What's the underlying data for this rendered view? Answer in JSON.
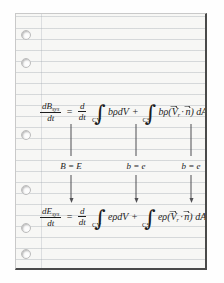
{
  "document": {
    "type": "handwritten-textbook-figure",
    "medium": "ruled notebook paper",
    "title": "Reynolds Transport Theorem specialized to energy",
    "paper": {
      "hole_count": 6,
      "hole_positions_y": [
        29,
        57,
        129,
        184,
        222,
        248
      ],
      "background_color": "#f7f7f5",
      "rule_color": "#969ea8",
      "border_color": "#4a4a4a"
    }
  },
  "equations": {
    "top": {
      "name": "general-reynolds-transport-theorem",
      "lhs": {
        "numerator": "dB",
        "numerator_subscript": "sys",
        "denominator": "dt"
      },
      "equals": "=",
      "rhs_operator_numerator": "d",
      "rhs_operator_denominator": "dt",
      "volume_integral": {
        "limit": "CV",
        "integrand": "bρdV"
      },
      "plus": "+",
      "surface_integral": {
        "limit": "CS",
        "integrand_prefix": "bρ(",
        "vector_v": "V",
        "vector_v_subscript": "r",
        "dot": "·",
        "vector_n": "n",
        "integrand_suffix": ") dA"
      }
    },
    "bottom": {
      "name": "energy-equation",
      "lhs": {
        "numerator": "dE",
        "numerator_subscript": "sys",
        "denominator": "dt"
      },
      "equals": "=",
      "rhs_operator_numerator": "d",
      "rhs_operator_denominator": "dt",
      "volume_integral": {
        "limit": "CV",
        "integrand": "eρdV"
      },
      "plus": "+",
      "surface_integral": {
        "limit": "CS",
        "integrand_prefix": "eρ(",
        "vector_v": "V",
        "vector_v_subscript": "r",
        "dot": "·",
        "vector_n": "n",
        "integrand_suffix": ") dA"
      }
    }
  },
  "substitutions": [
    {
      "name": "substitution-B-equals-E",
      "label": "B = E",
      "x": 55
    },
    {
      "name": "substitution-b-equals-e-volume",
      "label": "b = e",
      "x": 120
    },
    {
      "name": "substitution-b-equals-e-surface",
      "label": "b = e",
      "x": 175
    }
  ],
  "arrows": {
    "upper": [
      {
        "x": 55,
        "top": 110,
        "height": 32
      },
      {
        "x": 120,
        "top": 110,
        "height": 32
      },
      {
        "x": 175,
        "top": 110,
        "height": 32
      }
    ],
    "lower": [
      {
        "x": 55,
        "top": 157,
        "height": 28
      },
      {
        "x": 120,
        "top": 157,
        "height": 28
      },
      {
        "x": 175,
        "top": 157,
        "height": 28
      }
    ],
    "color": "#4f4f52",
    "direction": "down"
  }
}
